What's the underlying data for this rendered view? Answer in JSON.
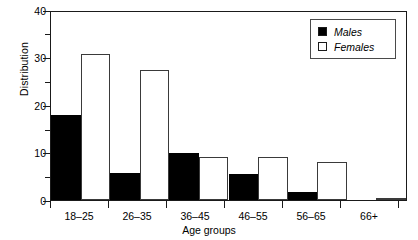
{
  "chart_data": {
    "type": "bar",
    "title": "",
    "xlabel": "Age groups",
    "ylabel": "Distribution",
    "categories": [
      "18–25",
      "26–35",
      "36–45",
      "46–55",
      "56–65",
      "66+"
    ],
    "series": [
      {
        "name": "Males",
        "color": "#000000",
        "fill": "solid",
        "values": [
          18,
          5.7,
          10,
          5.5,
          1.7,
          0
        ]
      },
      {
        "name": "Females",
        "color": "#ffffff",
        "fill": "open",
        "values": [
          31,
          27.7,
          9.2,
          9.2,
          8,
          0.5
        ]
      }
    ],
    "ylim": [
      0,
      40
    ],
    "yticks": [
      0,
      10,
      20,
      30,
      40
    ],
    "ytick_labels": [
      "0",
      "10",
      "20",
      "30",
      "40"
    ],
    "yminor_ticks": [
      5,
      15,
      25,
      35
    ],
    "grid": false,
    "legend": {
      "position": "top-right",
      "entries": [
        {
          "label": "Males",
          "marker": "filled-square"
        },
        {
          "label": "Females",
          "marker": "open-square"
        }
      ]
    }
  }
}
